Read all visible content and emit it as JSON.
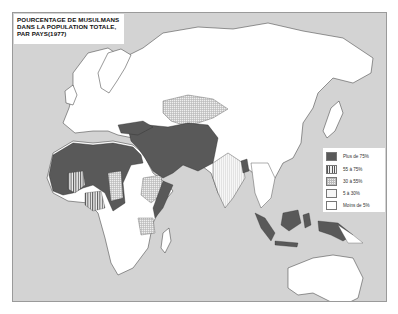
{
  "title": {
    "lines": [
      "POURCENTAGE DE MUSULMANS",
      "DANS LA POPULATION TOTALE,",
      "PAR PAYS(1977)"
    ]
  },
  "legend": {
    "items": [
      {
        "label": "Plus de 75%",
        "pattern": "dark",
        "color": "#595959"
      },
      {
        "label": "55 à 75%",
        "pattern": "vertical-stripes",
        "color": "#555555"
      },
      {
        "label": "30 à 55%",
        "pattern": "cross-hatch",
        "color": "#bbbbbb"
      },
      {
        "label": "5 à 30%",
        "pattern": "light-stripes",
        "color": "#d6d6d6"
      },
      {
        "label": "Moins de 5%",
        "pattern": "white",
        "color": "#ffffff"
      }
    ]
  },
  "colors": {
    "ocean": "#d3d3d3",
    "land": "#ffffff",
    "border": "#333333",
    "plus_75": "#595959"
  }
}
